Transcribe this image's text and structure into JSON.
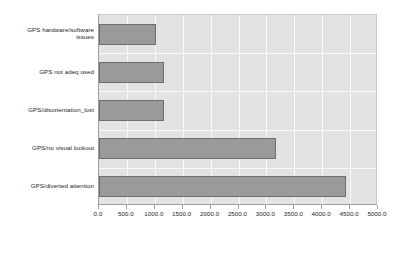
{
  "chart_data": {
    "type": "bar",
    "orientation": "horizontal",
    "title": "",
    "xlabel": "",
    "ylabel": "",
    "categories": [
      "GPS hardware/software issues",
      "GPS not adeq used",
      "GPS/disorientation_lost",
      "GPS/no visual lookout",
      "GPS/diverted attention"
    ],
    "values": [
      1020,
      1160,
      1165,
      3170,
      4430
    ],
    "xlim": [
      0,
      5000
    ],
    "xticks": [
      0,
      500,
      1000,
      1500,
      2000,
      2500,
      3000,
      3500,
      4000,
      4500,
      5000
    ],
    "xtick_labels": [
      "0.0",
      "500.0",
      "1000.0",
      "1500.0",
      "2000.0",
      "2500.0",
      "3000.0",
      "3500.0",
      "4000.0",
      "4500.0",
      "5000.0"
    ],
    "grid": true,
    "legend": null,
    "colors": {
      "bar_fill": "#9a9a9a",
      "bar_border": "#6e6e6e",
      "plot_background": "#e3e3e3",
      "gridline": "#fafafa",
      "axis": "#9f9f9f",
      "text": "#231f20",
      "page_background": "#ffffff"
    }
  },
  "category_label_lines": [
    [
      "GPS hardware/software",
      "issues"
    ],
    [
      "GPS not adeq used"
    ],
    [
      "GPS/disorientation_lost"
    ],
    [
      "GPS/no visual lookout"
    ],
    [
      "GPS/diverted attention"
    ]
  ]
}
